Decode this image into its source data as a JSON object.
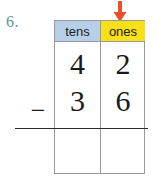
{
  "worksheet": {
    "problem_number": "6.",
    "problem_number_color": "#5c998c"
  },
  "arrow": {
    "name": "down-arrow-ones-column",
    "direction": "down",
    "color": "#e8502a",
    "points_to": "ones"
  },
  "table": {
    "headers": [
      {
        "label": "tens",
        "bg": "#b7cfe8"
      },
      {
        "label": "ones",
        "bg": "#f7e018"
      }
    ],
    "rows": [
      {
        "role": "minuend",
        "tens": "4",
        "ones": "2"
      },
      {
        "role": "subtrahend",
        "tens": "3",
        "ones": "6"
      },
      {
        "role": "difference",
        "tens": "",
        "ones": ""
      }
    ]
  },
  "operator": {
    "symbol": "−",
    "name": "minus"
  }
}
